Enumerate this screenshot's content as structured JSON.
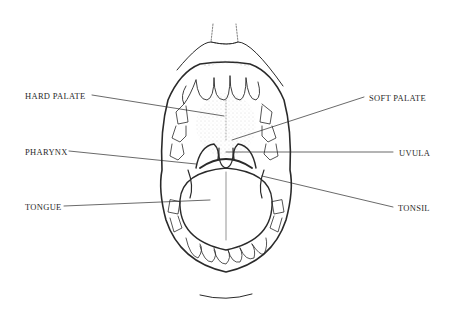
{
  "diagram": {
    "type": "anatomical illustration",
    "labels": [
      {
        "id": "hard-palate",
        "text": "HARD PALATE",
        "side": "left"
      },
      {
        "id": "pharynx",
        "text": "PHARYNX",
        "side": "left"
      },
      {
        "id": "tongue",
        "text": "TONGUE",
        "side": "left"
      },
      {
        "id": "soft-palate",
        "text": "SOFT PALATE",
        "side": "right"
      },
      {
        "id": "uvula",
        "text": "UVULA",
        "side": "right"
      },
      {
        "id": "tonsil",
        "text": "TONSIL",
        "side": "right"
      }
    ],
    "colors": {
      "ink": "#2a2a2a",
      "background": "#ffffff"
    }
  }
}
